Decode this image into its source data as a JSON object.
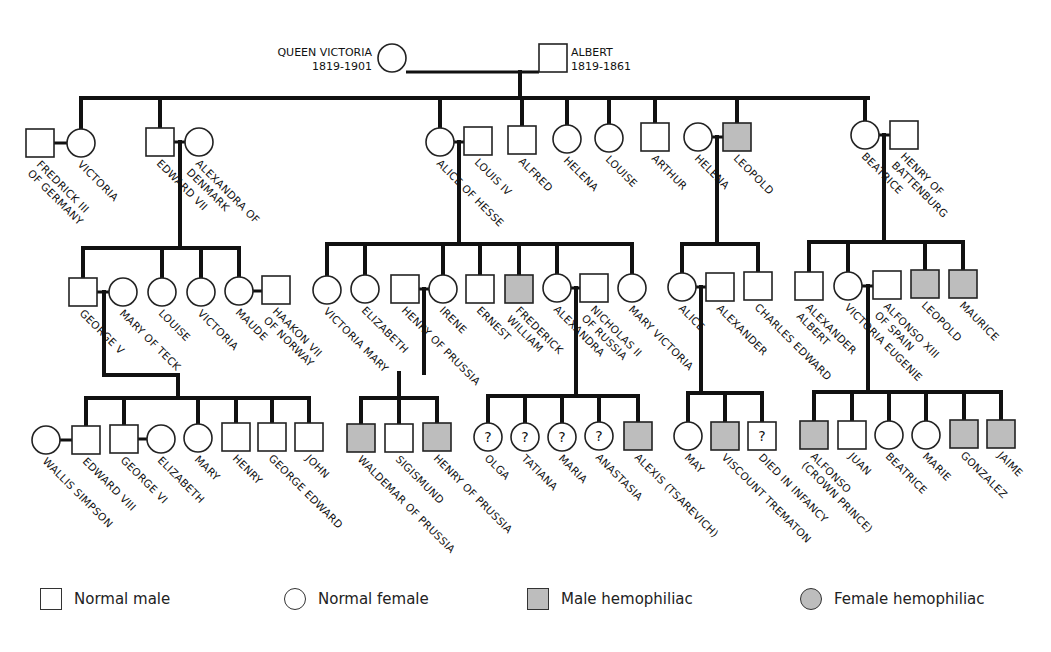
{
  "colors": {
    "affected": "#bdbdbd",
    "normal": "#ffffff",
    "line": "#111111"
  },
  "founders": [
    {
      "id": "qv",
      "name": "QUEEN VICTORIA",
      "years": "1819-1901",
      "sex": "F",
      "x": 392,
      "y": 58
    },
    {
      "id": "al",
      "name": "ALBERT",
      "years": "1819-1861",
      "sex": "M",
      "x": 553,
      "y": 58
    }
  ],
  "people": [
    {
      "id": "fr3",
      "sex": "M",
      "x": 40,
      "y": 143,
      "label": "FREDRICK III|OF GERMANY"
    },
    {
      "id": "vic",
      "sex": "F",
      "x": 81,
      "y": 143,
      "label": "VICTORIA"
    },
    {
      "id": "e7",
      "sex": "M",
      "x": 160,
      "y": 142,
      "label": "EDWARD VII"
    },
    {
      "id": "alx",
      "sex": "F",
      "x": 199,
      "y": 142,
      "label": "ALEXANDRA OF|DENMARK"
    },
    {
      "id": "alc",
      "sex": "F",
      "x": 440,
      "y": 142,
      "label": "ALICE OF HESSE"
    },
    {
      "id": "l4",
      "sex": "M",
      "x": 478,
      "y": 141,
      "label": "LOUIS IV"
    },
    {
      "id": "alf",
      "sex": "M",
      "x": 522,
      "y": 140,
      "label": "ALFRED"
    },
    {
      "id": "hel",
      "sex": "F",
      "x": 567,
      "y": 139,
      "label": "HELENA"
    },
    {
      "id": "lou",
      "sex": "F",
      "x": 609,
      "y": 138,
      "label": "LOUISE"
    },
    {
      "id": "art",
      "sex": "M",
      "x": 655,
      "y": 137,
      "label": "ARTHUR"
    },
    {
      "id": "he2",
      "sex": "F",
      "x": 698,
      "y": 137,
      "label": "HELENA"
    },
    {
      "id": "leo",
      "sex": "M",
      "x": 737,
      "y": 137,
      "affected": true,
      "label": "LEOPOLD"
    },
    {
      "id": "bea",
      "sex": "F",
      "x": 865,
      "y": 135,
      "label": "BEATRICE"
    },
    {
      "id": "hob",
      "sex": "M",
      "x": 904,
      "y": 135,
      "label": "HENRY OF|BATTENBURG"
    },
    {
      "id": "g5",
      "sex": "M",
      "x": 83,
      "y": 292,
      "label": "GEORGE V"
    },
    {
      "id": "mot",
      "sex": "F",
      "x": 123,
      "y": 292,
      "label": "MARY OF TECK"
    },
    {
      "id": "lo2",
      "sex": "F",
      "x": 162,
      "y": 292,
      "label": "LOUISE"
    },
    {
      "id": "vi2",
      "sex": "F",
      "x": 201,
      "y": 292,
      "label": "VICTORIA"
    },
    {
      "id": "mau",
      "sex": "F",
      "x": 239,
      "y": 291,
      "label": "MAUDE"
    },
    {
      "id": "hk7",
      "sex": "M",
      "x": 276,
      "y": 290,
      "label": "HAAKON VII|OF NORWAY"
    },
    {
      "id": "vm",
      "sex": "F",
      "x": 327,
      "y": 290,
      "label": "VICTORIA MARY"
    },
    {
      "id": "eli",
      "sex": "F",
      "x": 365,
      "y": 289,
      "label": "ELIZABETH"
    },
    {
      "id": "hop",
      "sex": "M",
      "x": 405,
      "y": 289,
      "label": "HENRY OF PRUSSIA"
    },
    {
      "id": "ire",
      "sex": "F",
      "x": 443,
      "y": 289,
      "label": "IRENE"
    },
    {
      "id": "ern",
      "sex": "M",
      "x": 480,
      "y": 289,
      "label": "ERNEST"
    },
    {
      "id": "fw",
      "sex": "M",
      "x": 519,
      "y": 289,
      "affected": true,
      "label": "FREDERICK|WILLIAM"
    },
    {
      "id": "ax2",
      "sex": "F",
      "x": 557,
      "y": 288,
      "label": "ALEXANDRA"
    },
    {
      "id": "n2",
      "sex": "M",
      "x": 594,
      "y": 288,
      "label": "NICHOLAS II|OF RUSSIA"
    },
    {
      "id": "mv",
      "sex": "F",
      "x": 632,
      "y": 288,
      "label": "MARY VICTORIA"
    },
    {
      "id": "ali",
      "sex": "F",
      "x": 682,
      "y": 287,
      "label": "ALICE"
    },
    {
      "id": "axr",
      "sex": "M",
      "x": 720,
      "y": 287,
      "label": "ALEXANDER"
    },
    {
      "id": "ce",
      "sex": "M",
      "x": 758,
      "y": 286,
      "label": "CHARLES EDWARD"
    },
    {
      "id": "aa",
      "sex": "M",
      "x": 809,
      "y": 286,
      "label": "ALEXANDER|ALBERT"
    },
    {
      "id": "ve",
      "sex": "F",
      "x": 848,
      "y": 286,
      "label": "VICTORIA EUGENIE"
    },
    {
      "id": "a13",
      "sex": "M",
      "x": 887,
      "y": 285,
      "label": "ALFONSO XIII|OF SPAIN"
    },
    {
      "id": "le2",
      "sex": "M",
      "x": 925,
      "y": 284,
      "affected": true,
      "label": "LEOPOLD"
    },
    {
      "id": "mce",
      "sex": "M",
      "x": 963,
      "y": 284,
      "affected": true,
      "label": "MAURICE"
    },
    {
      "id": "ws",
      "sex": "F",
      "x": 46,
      "y": 440,
      "label": "WALLIS SIMPSON"
    },
    {
      "id": "e8",
      "sex": "M",
      "x": 86,
      "y": 440,
      "label": "EDWARD VIII"
    },
    {
      "id": "g6",
      "sex": "M",
      "x": 124,
      "y": 439,
      "label": "GEORGE VI"
    },
    {
      "id": "el2",
      "sex": "F",
      "x": 161,
      "y": 439,
      "label": "ELIZABETH"
    },
    {
      "id": "mry",
      "sex": "F",
      "x": 198,
      "y": 438,
      "label": "MARY"
    },
    {
      "id": "hen",
      "sex": "M",
      "x": 236,
      "y": 437,
      "label": "HENRY"
    },
    {
      "id": "ge",
      "sex": "M",
      "x": 272,
      "y": 437,
      "label": "GEORGE EDWARD"
    },
    {
      "id": "joh",
      "sex": "M",
      "x": 309,
      "y": 437,
      "label": "JOHN"
    },
    {
      "id": "wal",
      "sex": "M",
      "x": 361,
      "y": 438,
      "affected": true,
      "label": "WALDEMAR OF PRUSSIA"
    },
    {
      "id": "sig",
      "sex": "M",
      "x": 399,
      "y": 438,
      "label": "SIGISMUND"
    },
    {
      "id": "hp2",
      "sex": "M",
      "x": 437,
      "y": 437,
      "affected": true,
      "label": "HENRY OF PRUSSIA"
    },
    {
      "id": "olg",
      "sex": "F",
      "x": 488,
      "y": 437,
      "unknown": true,
      "label": "OLGA"
    },
    {
      "id": "tat",
      "sex": "F",
      "x": 525,
      "y": 437,
      "unknown": true,
      "label": "TATIANA"
    },
    {
      "id": "mar",
      "sex": "F",
      "x": 562,
      "y": 437,
      "unknown": true,
      "label": "MARIA"
    },
    {
      "id": "ana",
      "sex": "F",
      "x": 599,
      "y": 436,
      "unknown": true,
      "label": "ANASTASIA"
    },
    {
      "id": "alx2",
      "sex": "M",
      "x": 638,
      "y": 436,
      "affected": true,
      "label": "ALEXIS (TSAREVICH)"
    },
    {
      "id": "may",
      "sex": "F",
      "x": 688,
      "y": 436,
      "label": "MAY"
    },
    {
      "id": "vt",
      "sex": "M",
      "x": 725,
      "y": 436,
      "affected": true,
      "label": "VISCOUNT TREMATON"
    },
    {
      "id": "dii",
      "sex": "M",
      "x": 762,
      "y": 436,
      "unknown": true,
      "label": "DIED IN INFANCY"
    },
    {
      "id": "alfo",
      "sex": "M",
      "x": 814,
      "y": 435,
      "affected": true,
      "label": "ALFONSO|(CROWN PRINCE)"
    },
    {
      "id": "jua",
      "sex": "M",
      "x": 852,
      "y": 435,
      "label": "JUAN"
    },
    {
      "id": "bt2",
      "sex": "F",
      "x": 889,
      "y": 435,
      "label": "BEATRICE"
    },
    {
      "id": "mri",
      "sex": "F",
      "x": 926,
      "y": 435,
      "label": "MARIE"
    },
    {
      "id": "gon",
      "sex": "M",
      "x": 964,
      "y": 434,
      "affected": true,
      "label": "GONZALEZ"
    },
    {
      "id": "jai",
      "sex": "M",
      "x": 1001,
      "y": 434,
      "affected": true,
      "label": "JAIME"
    }
  ],
  "legend": [
    {
      "symbol": "square",
      "affected": false,
      "label": "Normal male"
    },
    {
      "symbol": "circle",
      "affected": false,
      "label": "Normal female"
    },
    {
      "symbol": "square",
      "affected": true,
      "label": "Male hemophiliac"
    },
    {
      "symbol": "circle",
      "affected": true,
      "label": "Female hemophiliac"
    }
  ]
}
